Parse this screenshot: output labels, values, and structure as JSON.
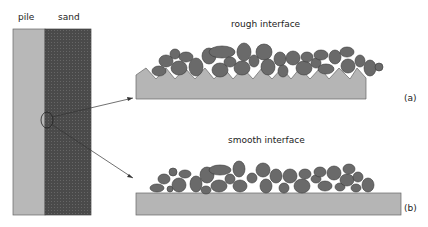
{
  "labels": {
    "pile": "pile",
    "sand": "sand",
    "rough": "rough interface",
    "smooth": "smooth interface",
    "a": "(a)",
    "b": "(b)"
  },
  "colors": {
    "pile": "#b8b8b8",
    "sand": "#4a4a4a",
    "grain": "#6a6a6a",
    "grain_stroke": "#3a3a3a",
    "substrate": "#b5b5b5",
    "line": "#333333"
  }
}
